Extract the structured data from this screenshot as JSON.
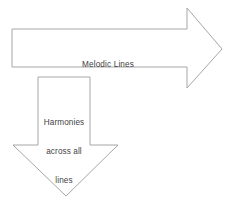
{
  "diagram": {
    "background_color": "#ffffff",
    "stroke_color": "#a6a6a6",
    "fill_color": "#ffffff",
    "text_color": "#3f3f3f",
    "shapes": [
      {
        "name": "right-arrow",
        "direction": "right",
        "label": "Melodic Lines",
        "points": "12,29 187,29 187,8 222,49 187,88 187,67 12,67"
      },
      {
        "name": "down-arrow",
        "direction": "down",
        "label": "Harmonies across all lines",
        "points": "38,77 90,77 90,145 118,145 66,196 13,145 38,145"
      }
    ]
  },
  "labels": {
    "melodic": {
      "text": "Melodic Lines",
      "lines": [
        "Melodic Lines"
      ]
    },
    "harmonies": {
      "text": "Harmonies across all lines",
      "lines": [
        "Harmonies",
        "across all",
        "lines"
      ]
    }
  }
}
